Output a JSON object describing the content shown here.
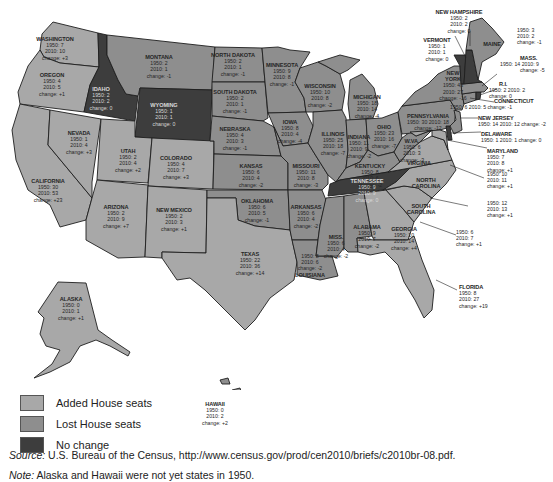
{
  "legend": {
    "items": [
      {
        "label": "Added House seats",
        "color": "#a8a8a8"
      },
      {
        "label": "Lost House seats",
        "color": "#8e8e8e"
      },
      {
        "label": "No change",
        "color": "#3d3d3d"
      }
    ]
  },
  "colors": {
    "added": "#a8a8a8",
    "lost": "#8e8e8e",
    "nochange": "#3d3d3d",
    "border": "#1e1e1e"
  },
  "source": {
    "prefix": "Source:",
    "text": " U.S. Bureau of the Census, http://www.census.gov/prod/cen2010/briefs/c2010br-08.pdf."
  },
  "note": {
    "prefix": "Note:",
    "text": " Alaska and Hawaii were not yet states in 1950."
  },
  "states": {
    "washington": {
      "name": "WASHINGTON",
      "y1950": "1950: 7",
      "y2010": "2010: 10",
      "change": "change: +3"
    },
    "oregon": {
      "name": "OREGON",
      "y1950": "1950: 4",
      "y2010": "2010: 5",
      "change": "change: +1"
    },
    "california": {
      "name": "CALIFORNIA",
      "y1950": "1950: 30",
      "y2010": "2010: 53",
      "change": "change: +23"
    },
    "nevada": {
      "name": "NEVADA",
      "y1950": "1950: 1",
      "y2010": "2010: 4",
      "change": "change: +3"
    },
    "idaho": {
      "name": "IDAHO",
      "y1950": "1950: 2",
      "y2010": "2010: 2",
      "change": "change: 0"
    },
    "montana": {
      "name": "MONTANA",
      "y1950": "1950: 2",
      "y2010": "2010: 1",
      "change": "change: -1"
    },
    "wyoming": {
      "name": "WYOMING",
      "y1950": "1950: 1",
      "y2010": "2010: 1",
      "change": "change: 0"
    },
    "utah": {
      "name": "UTAH",
      "y1950": "1950: 2",
      "y2010": "2010: 4",
      "change": "change: +2"
    },
    "colorado": {
      "name": "COLORADO",
      "y1950": "1950: 4",
      "y2010": "2010: 7",
      "change": "change: +3"
    },
    "arizona": {
      "name": "ARIZONA",
      "y1950": "1950: 2",
      "y2010": "2010: 9",
      "change": "change: +7"
    },
    "new_mexico": {
      "name": "NEW MEXICO",
      "y1950": "1950: 2",
      "y2010": "2010: 3",
      "change": "change: +1"
    },
    "north_dakota": {
      "name": "NORTH DAKOTA",
      "y1950": "1950: 2",
      "y2010": "2010: 1",
      "change": "change: -1"
    },
    "south_dakota": {
      "name": "SOUTH DAKOTA",
      "y1950": "1950: 2",
      "y2010": "2010: 1",
      "change": "change: -1"
    },
    "nebraska": {
      "name": "NEBRASKA",
      "y1950": "1950: 4",
      "y2010": "2010: 3",
      "change": "change: -1"
    },
    "kansas": {
      "name": "KANSAS",
      "y1950": "1950: 6",
      "y2010": "2010: 4",
      "change": "change: -2"
    },
    "oklahoma": {
      "name": "OKLAHOMA",
      "y1950": "1950: 6",
      "y2010": "2010: 5",
      "change": "change: -1"
    },
    "texas": {
      "name": "TEXAS",
      "y1950": "1950: 22",
      "y2010": "2010: 36",
      "change": "change: +14"
    },
    "minnesota": {
      "name": "MINNESOTA",
      "y1950": "1950: 9",
      "y2010": "2010: 8",
      "change": "change: -1"
    },
    "iowa": {
      "name": "IOWA",
      "y1950": "1950: 8",
      "y2010": "2010: 4",
      "change": "change: -4"
    },
    "missouri": {
      "name": "MISSOURI",
      "y1950": "1950: 11",
      "y2010": "2010: 8",
      "change": "change: -3"
    },
    "arkansas": {
      "name": "ARKANSAS",
      "y1950": "1950: 6",
      "y2010": "2010: 4",
      "change": "change: -2"
    },
    "louisiana": {
      "name": "LOUISIANA",
      "y1950": "1950: 8",
      "y2010": "2010: 6",
      "change": "change: -2"
    },
    "wisconsin": {
      "name": "WISCONSIN",
      "y1950": "1950: 10",
      "y2010": "2010: 8",
      "change": "change: -2"
    },
    "illinois": {
      "name": "ILLINOIS",
      "y1950": "1950: 25",
      "y2010": "2010: 18",
      "change": "change: -7"
    },
    "michigan": {
      "name": "MICHIGAN",
      "y1950": "1950: 18",
      "y2010": "2010: 14",
      "change": "change: -4"
    },
    "indiana": {
      "name": "INDIANA",
      "y1950": "1950: 11",
      "y2010": "2010: 9",
      "change": "change: -2"
    },
    "ohio": {
      "name": "OHIO",
      "y1950": "1950: 23",
      "y2010": "2010: 16",
      "change": "change: -7"
    },
    "kentucky": {
      "name": "KENTUCKY",
      "y1950": "1950: 8",
      "y2010": "2010: 6",
      "change": "change: -2"
    },
    "tennessee": {
      "name": "TENNESSEE",
      "y1950": "1950: 9",
      "y2010": "2010: 9",
      "change": "change: 0"
    },
    "mississippi": {
      "name": "MISS.",
      "y1950": "1950: 6",
      "y2010": "2010: 4",
      "change": "change: -2"
    },
    "alabama": {
      "name": "ALABAMA",
      "y1950": "1950: 9",
      "y2010": "2010: 7",
      "change": "change: -2"
    },
    "georgia": {
      "name": "GEORGIA",
      "y1950": "1950: 10",
      "y2010": "2010: 14",
      "change": "change: +4"
    },
    "florida": {
      "name": "FLORIDA",
      "y1950": "1950: 8",
      "y2010": "2010: 27",
      "change": "change: +19"
    },
    "south_carolina": {
      "name": "SOUTH CAROLINA",
      "y1950": "1950: 6",
      "y2010": "2010: 7",
      "change": "change: +1"
    },
    "north_carolina": {
      "name": "NORTH CAROLINA",
      "y1950": "1950: 12",
      "y2010": "2010: 13",
      "change": "change: +1"
    },
    "virginia": {
      "name": "VIRGINIA",
      "y1950": "1950: 10",
      "y2010": "2010: 11",
      "change": "change: +1"
    },
    "west_virginia": {
      "name": "W.VA.",
      "y1950": "1950: 6",
      "y2010": "2010: 3",
      "change": "change: -3"
    },
    "pennsylvania": {
      "name": "PENNSYLVANIA",
      "y1950": "1950: 30",
      "y2010": "2010: 18",
      "change": "change: -12"
    },
    "new_york": {
      "name": "NEW YORK",
      "y1950": "1950: 43",
      "y2010": "2010: 27",
      "change": "change: -16"
    },
    "maryland": {
      "name": "MARYLAND",
      "y1950": "1950: 7",
      "y2010": "2010: 8",
      "change": "change: +1"
    },
    "delaware": {
      "name": "DELAWARE",
      "line": "1950: 1  2010: 1  change: 0"
    },
    "new_jersey": {
      "name": "NEW JERSEY",
      "line": "1950: 14  2010: 12  change: -2"
    },
    "connecticut": {
      "name": "CONNECTICUT",
      "line": "1950: 6  2010: 5  change: -1"
    },
    "rhode_island": {
      "name": "R.I.",
      "line": "1950: 2  2010: 2",
      "change": "change: 0"
    },
    "massachusetts": {
      "name": "MASS.",
      "line": "1950: 14  2010: 9",
      "change": "change: -5"
    },
    "vermont": {
      "name": "VERMONT",
      "y1950": "1950: 1",
      "y2010": "2010: 1",
      "change": "change: 0"
    },
    "new_hampshire": {
      "name": "NEW HAMPSHIRE",
      "y1950": "1950: 2",
      "y2010": "2010: 2",
      "change": "change: 0"
    },
    "maine": {
      "name": "MAINE",
      "y1950": "1950: 3",
      "y2010": "2010: 2",
      "change": "change: -1"
    },
    "alaska": {
      "name": "ALASKA",
      "y1950": "1950: 0",
      "y2010": "2010: 1",
      "change": "change: +1"
    },
    "hawaii": {
      "name": "HAWAII",
      "y1950": "1950: 0",
      "y2010": "2010: 2",
      "change": "change: +2"
    }
  }
}
